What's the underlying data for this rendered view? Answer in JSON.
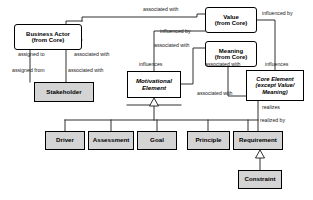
{
  "diagram": {
    "type": "uml-class-diagram",
    "canvas": {
      "width": 313,
      "height": 200,
      "background": "#ffffff"
    },
    "colors": {
      "node_fill_grey": "#d4d4d4",
      "node_fill_white": "#ffffff",
      "stroke": "#000000",
      "label_text": "#1a1a1a"
    },
    "nodes": [
      {
        "id": "business-actor",
        "lines": [
          "Business Actor",
          "(from Core)"
        ],
        "style": "white-rounded",
        "x": 14,
        "y": 24,
        "w": 68,
        "h": 26,
        "font_size": 6.0,
        "italic": false
      },
      {
        "id": "stakeholder",
        "lines": [
          "Stakeholder"
        ],
        "style": "grey",
        "x": 34,
        "y": 82,
        "w": 60,
        "h": 20,
        "font_size": 6.2,
        "italic": false
      },
      {
        "id": "value",
        "lines": [
          "Value",
          "(from Core)"
        ],
        "style": "white-rounded",
        "x": 205,
        "y": 7,
        "w": 52,
        "h": 26,
        "font_size": 6.0,
        "italic": false
      },
      {
        "id": "meaning",
        "lines": [
          "Meaning",
          "(from Core)"
        ],
        "style": "white-rounded",
        "x": 205,
        "y": 41,
        "w": 52,
        "h": 26,
        "font_size": 6.0,
        "italic": false
      },
      {
        "id": "core-element",
        "lines": [
          "Core Element",
          "(except Value/",
          "Meaning)"
        ],
        "style": "white-square",
        "x": 246,
        "y": 70,
        "w": 58,
        "h": 31,
        "font_size": 5.8,
        "italic": true
      },
      {
        "id": "motivational-element",
        "lines": [
          "Motivational",
          "Element"
        ],
        "style": "white-square",
        "x": 127,
        "y": 71,
        "w": 54,
        "h": 27,
        "font_size": 6.2,
        "italic": true
      },
      {
        "id": "driver",
        "lines": [
          "Driver"
        ],
        "style": "grey",
        "x": 45,
        "y": 131,
        "w": 40,
        "h": 19,
        "font_size": 6.2,
        "italic": false
      },
      {
        "id": "assessment",
        "lines": [
          "Assessment"
        ],
        "style": "grey",
        "x": 88,
        "y": 131,
        "w": 46,
        "h": 19,
        "font_size": 6.2,
        "italic": false
      },
      {
        "id": "goal",
        "lines": [
          "Goal"
        ],
        "style": "grey",
        "x": 137,
        "y": 131,
        "w": 40,
        "h": 19,
        "font_size": 6.2,
        "italic": false
      },
      {
        "id": "principle",
        "lines": [
          "Principle"
        ],
        "style": "grey",
        "x": 187,
        "y": 131,
        "w": 43,
        "h": 19,
        "font_size": 6.2,
        "italic": false
      },
      {
        "id": "requirement",
        "lines": [
          "Requirement"
        ],
        "style": "grey",
        "x": 233,
        "y": 131,
        "w": 50,
        "h": 19,
        "font_size": 6.2,
        "italic": false
      },
      {
        "id": "constraint",
        "lines": [
          "Constraint"
        ],
        "style": "grey",
        "x": 238,
        "y": 170,
        "w": 44,
        "h": 19,
        "font_size": 6.2,
        "italic": false
      }
    ],
    "edge_labels": [
      {
        "id": "assigned-to",
        "text": "assigned to",
        "x": 18,
        "y": 52,
        "font_size": 5.2
      },
      {
        "id": "assigned-from",
        "text": "assigned from",
        "x": 12,
        "y": 68,
        "font_size": 5.2
      },
      {
        "id": "associated-with-1",
        "text": "associated with",
        "x": 74,
        "y": 52,
        "font_size": 5.2
      },
      {
        "id": "associated-with-2",
        "text": "associated with",
        "x": 68,
        "y": 68,
        "font_size": 5.2
      },
      {
        "id": "associated-with-3",
        "text": "associated with",
        "x": 143,
        "y": 7,
        "font_size": 5.2
      },
      {
        "id": "influenced-by-1",
        "text": "influenced by",
        "x": 160,
        "y": 29,
        "font_size": 5.2
      },
      {
        "id": "associated-with-4",
        "text": "associated with",
        "x": 154,
        "y": 43,
        "font_size": 5.2
      },
      {
        "id": "influenced-by-2",
        "text": "influenced by",
        "x": 262,
        "y": 11,
        "font_size": 5.2
      },
      {
        "id": "influences-1",
        "text": "influences",
        "x": 139,
        "y": 62,
        "font_size": 5.2
      },
      {
        "id": "associated-with-5",
        "text": "associated with",
        "x": 205,
        "y": 62,
        "font_size": 5.2
      },
      {
        "id": "associated-with-6",
        "text": "associated with",
        "x": 197,
        "y": 91,
        "font_size": 5.2
      },
      {
        "id": "influences-2",
        "text": "influences",
        "x": 265,
        "y": 62,
        "font_size": 5.2
      },
      {
        "id": "realizes",
        "text": "realizes",
        "x": 262,
        "y": 105,
        "font_size": 5.2
      },
      {
        "id": "realized-by",
        "text": "realized by",
        "x": 260,
        "y": 118,
        "font_size": 5.2
      }
    ],
    "relationships": [
      {
        "from": "business-actor",
        "to": "stakeholder",
        "kind": "association",
        "labels": [
          "assigned to",
          "assigned from"
        ]
      },
      {
        "from": "stakeholder",
        "to": "value",
        "kind": "association",
        "labels": [
          "associated with",
          "associated with"
        ]
      },
      {
        "from": "motivational-element",
        "to": "value",
        "kind": "association",
        "labels": [
          "influenced by",
          "influences"
        ]
      },
      {
        "from": "motivational-element",
        "to": "meaning",
        "kind": "association",
        "labels": [
          "associated with"
        ]
      },
      {
        "from": "value",
        "to": "core-element",
        "kind": "association",
        "labels": [
          "influenced by",
          "influences"
        ]
      },
      {
        "from": "meaning",
        "to": "core-element",
        "kind": "association",
        "labels": [
          "associated with",
          "associated with"
        ]
      },
      {
        "from": "requirement",
        "to": "core-element",
        "kind": "association",
        "labels": [
          "realizes",
          "realized by"
        ]
      },
      {
        "from": "driver",
        "to": "motivational-element",
        "kind": "generalization"
      },
      {
        "from": "assessment",
        "to": "motivational-element",
        "kind": "generalization"
      },
      {
        "from": "goal",
        "to": "motivational-element",
        "kind": "generalization"
      },
      {
        "from": "principle",
        "to": "motivational-element",
        "kind": "generalization"
      },
      {
        "from": "requirement",
        "to": "motivational-element",
        "kind": "generalization"
      },
      {
        "from": "stakeholder",
        "to": "motivational-element",
        "kind": "generalization"
      },
      {
        "from": "constraint",
        "to": "requirement",
        "kind": "generalization"
      }
    ]
  }
}
